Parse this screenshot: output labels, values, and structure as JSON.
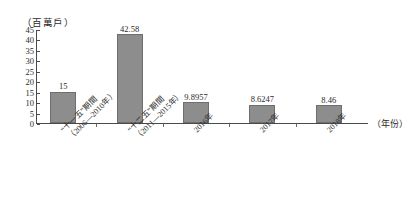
{
  "chart_data": {
    "type": "bar",
    "title": "",
    "subtitle": "",
    "xlabel": "（年份）",
    "ylabel": "（百萬戶）",
    "ylim": [
      0,
      45
    ],
    "ytick_step": 5,
    "ytick_labels": [
      "45",
      "40",
      "35",
      "30",
      "25",
      "20",
      "15",
      "10",
      "5",
      "0"
    ],
    "grid": false,
    "legend": null,
    "bar_color": "#8d8d8d",
    "bar_border_color": "#6e6e6e",
    "axis_color": "#4a4a4a",
    "categories": [
      "“十一五”期間\n（2006—2010年）",
      "“十二五”期間\n（2011—2015年）",
      "2016年",
      "2017年",
      "2018年"
    ],
    "category_lines": [
      {
        "line1": "“十一五”期間",
        "line2": "（2006—2010年）"
      },
      {
        "line1": "“十二五”期間",
        "line2": "（2011—2015年）"
      },
      {
        "line1": "2016年",
        "line2": ""
      },
      {
        "line1": "2017年",
        "line2": ""
      },
      {
        "line1": "2018年",
        "line2": ""
      }
    ],
    "values": [
      15,
      42.58,
      9.8957,
      8.6247,
      8.46
    ],
    "value_labels": [
      "15",
      "42.58",
      "9.8957",
      "8.6247",
      "8.46"
    ]
  }
}
